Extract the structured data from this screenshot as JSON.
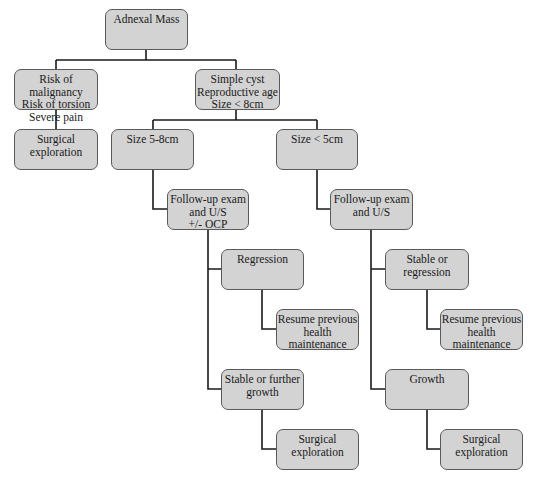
{
  "diagram": {
    "title": "Adnexal Mass",
    "line_color": "#1a1a1a",
    "box_fill": "#d3d3d3",
    "box_border": "#5a5a5a",
    "nodes": [
      {
        "id": "root",
        "text": "Adnexal Mass",
        "x": 105,
        "y": 9,
        "w": 83,
        "h": 41
      },
      {
        "id": "risk",
        "text": "Risk of malignancy\nRisk of torsion\nSevere pain",
        "x": 14,
        "y": 69,
        "w": 84,
        "h": 41
      },
      {
        "id": "simple",
        "text": "Simple cyst\nReproductive age\nSize < 8cm",
        "x": 195,
        "y": 69,
        "w": 85,
        "h": 41
      },
      {
        "id": "surg1",
        "text": "Surgical\nexploration",
        "x": 14,
        "y": 129,
        "w": 84,
        "h": 41
      },
      {
        "id": "size58",
        "text": "Size 5-8cm",
        "x": 111,
        "y": 129,
        "w": 83,
        "h": 41
      },
      {
        "id": "size5",
        "text": "Size < 5cm",
        "x": 276,
        "y": 129,
        "w": 82,
        "h": 41
      },
      {
        "id": "fu1",
        "text": "Follow-up exam\nand U/S\n+/- OCP",
        "x": 167,
        "y": 189,
        "w": 82,
        "h": 41
      },
      {
        "id": "fu2",
        "text": "Follow-up exam\nand U/S",
        "x": 330,
        "y": 189,
        "w": 83,
        "h": 41
      },
      {
        "id": "regr",
        "text": "Regression",
        "x": 221,
        "y": 249,
        "w": 83,
        "h": 41
      },
      {
        "id": "resume1",
        "text": "Resume previous\nhealth maintenance",
        "x": 276,
        "y": 309,
        "w": 83,
        "h": 41
      },
      {
        "id": "stable1",
        "text": "Stable or further\ngrowth",
        "x": 221,
        "y": 369,
        "w": 83,
        "h": 41
      },
      {
        "id": "surg2",
        "text": "Surgical\nexploration",
        "x": 276,
        "y": 429,
        "w": 83,
        "h": 41
      },
      {
        "id": "stable2",
        "text": "Stable or regression",
        "x": 385,
        "y": 249,
        "w": 84,
        "h": 41
      },
      {
        "id": "resume2",
        "text": "Resume previous\nhealth maintenance",
        "x": 440,
        "y": 309,
        "w": 83,
        "h": 41
      },
      {
        "id": "growth",
        "text": "Growth",
        "x": 385,
        "y": 369,
        "w": 84,
        "h": 41
      },
      {
        "id": "surg3",
        "text": "Surgical\nexploration",
        "x": 440,
        "y": 429,
        "w": 83,
        "h": 41
      }
    ],
    "connectors": [
      "M146 50 V60 M56 60 H236 M56 60 V69 M236 60 V69",
      "M56 110 V129",
      "M236 110 V120 M153 120 H317 M153 120 V129 M317 120 V129",
      "M153 170 V209 H167",
      "M317 170 V209 H330",
      "M208 230 V389 H221 M208 269 H221",
      "M371 230 V389 H385 M371 269 H385",
      "M262 290 V329 H276",
      "M262 410 V449 H276",
      "M427 290 V329 H440",
      "M427 410 V449 H440"
    ]
  }
}
